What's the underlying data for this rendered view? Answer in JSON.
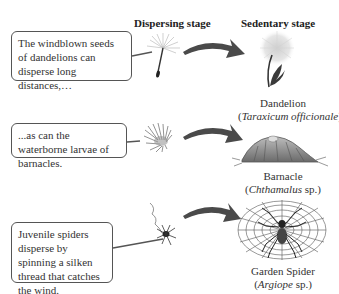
{
  "headings": {
    "dispersing": "Dispersing stage",
    "sedentary": "Sedentary stage"
  },
  "rows": [
    {
      "text": "The windblown seeds of dandelions can disperse long distances,…",
      "dispersing_icon": "dandelion-seed-icon",
      "sedentary_icon": "dandelion-plant-icon",
      "common_name": "Dandelion",
      "sci_prefix": "(",
      "sci_name": "Taraxicum officionale",
      "sci_suffix": ")"
    },
    {
      "text": "...as can the waterborne larvae of barnacles.",
      "dispersing_icon": "barnacle-larva-icon",
      "sedentary_icon": "barnacle-adult-icon",
      "common_name": "Barnacle",
      "sci_prefix": "(",
      "sci_name": "Chthamalus",
      "sci_suffix": " sp.)"
    },
    {
      "text": "Juvenile spiders disperse by spinning a silken thread that catches the wind.",
      "dispersing_icon": "juvenile-spider-icon",
      "sedentary_icon": "garden-spider-web-icon",
      "common_name": "Garden Spider",
      "sci_prefix": "(",
      "sci_name": "Argiope",
      "sci_suffix": " sp.)"
    }
  ],
  "colors": {
    "arrow": "#4a4a4a",
    "box_border": "#555555",
    "text": "#333333"
  }
}
